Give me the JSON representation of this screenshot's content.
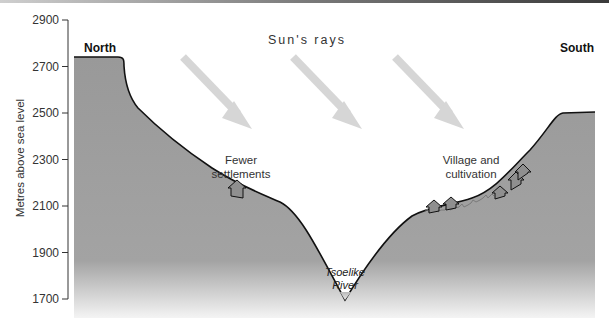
{
  "diagram": {
    "type": "valley-cross-section",
    "y_axis": {
      "title": "Metres above sea level",
      "ticks": [
        "2900",
        "2700",
        "2500",
        "2300",
        "2100",
        "1900",
        "1700"
      ]
    },
    "labels": {
      "north": "North",
      "south": "South",
      "sun_rays": "Sun's rays",
      "fewer_settlements_line1": "Fewer",
      "fewer_settlements_line2": "settlements",
      "village_line1": "Village and",
      "village_line2": "cultivation",
      "river_line1": "Tsoelike",
      "river_line2": "River"
    },
    "colors": {
      "terrain_fill": "#9a9a9a",
      "terrain_outline": "#111111",
      "sun_arrow": "#d6d6d6",
      "house_fill": "#8f8f8f",
      "axis": "#333333"
    },
    "sun_arrow_count": 3,
    "houses": {
      "north_slope": 1,
      "south_slope": 5
    }
  }
}
